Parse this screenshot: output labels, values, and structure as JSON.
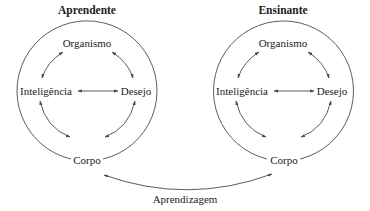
{
  "colors": {
    "stroke": "#4a4a4a",
    "text": "#222222",
    "background": "#ffffff"
  },
  "diagrams": [
    {
      "title": "Aprendente",
      "nodes": {
        "top": "Organismo",
        "left": "Inteligência",
        "right": "Desejo",
        "bottom": "Corpo"
      }
    },
    {
      "title": "Ensinante",
      "nodes": {
        "top": "Organismo",
        "left": "Inteligência",
        "right": "Desejo",
        "bottom": "Corpo"
      }
    }
  ],
  "connector": {
    "label": "Aprendizagem",
    "from": "Aprendente.Corpo",
    "to": "Ensinante.Corpo",
    "bidirectional": true
  },
  "edges": [
    [
      "Organismo",
      "Inteligência"
    ],
    [
      "Organismo",
      "Desejo"
    ],
    [
      "Inteligência",
      "Desejo"
    ],
    [
      "Inteligência",
      "Corpo"
    ],
    [
      "Desejo",
      "Corpo"
    ]
  ]
}
